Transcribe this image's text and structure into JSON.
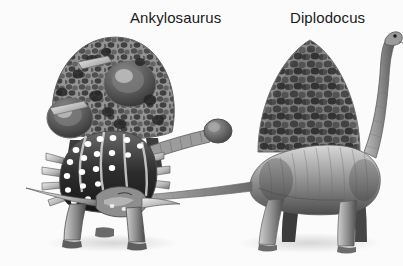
{
  "figure": {
    "kind": "grayscale-scientific-illustration",
    "background_color": "#fbfbfb",
    "subject_count": 2,
    "labels": [
      {
        "id": "ankylosaurus",
        "text": "Ankylosaurus"
      },
      {
        "id": "diplodocus",
        "text": "Diplodocus"
      }
    ]
  },
  "palette": {
    "label_text": "#1a1a1a",
    "background": "#fbfbfb",
    "ink_darkest": "#1c1c1c",
    "ink_dark": "#3a3a3a",
    "ink_mid": "#6e6e6e",
    "ink_light": "#a9a9a9",
    "ink_pale": "#d2d2d2",
    "highlight": "#f2f2f2",
    "stud_white": "#ffffff"
  },
  "subjects": {
    "ankylosaurus": {
      "label": "Ankylosaurus",
      "position": "left",
      "features": [
        "armoured dome back with cobbled osteoderms",
        "rows of white osteoderm studs",
        "lateral shoulder spikes",
        "long curved cheek horn pointing left",
        "bony club on tail",
        "four short stout legs with clawed feet"
      ]
    },
    "diplodocus": {
      "label": "Diplodocus",
      "position": "right",
      "features": [
        "cobbled mound-shaped back",
        "long neck curving up and to the right",
        "small head with dark eye",
        "very long tapering tail sweeping to the left",
        "four columnar legs"
      ]
    }
  }
}
